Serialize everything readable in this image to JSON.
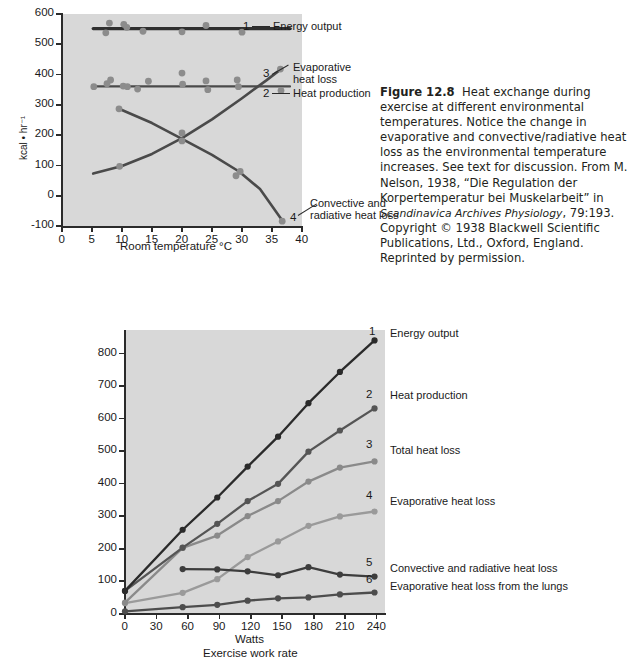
{
  "page": {
    "width": 637,
    "height": 668
  },
  "caption": {
    "figure_label": "Figure 12.8",
    "text_1": "Heat exchange during exercise at different environmental temperatures. Notice the change in evaporative and convective/radiative heat loss as the environmental temperature increases. See text for discussion. From M. Nelson, 1938, “Die Regulation der Korpertemperatur bei Muskelarbeit” in ",
    "italic_1": "Scandinavica Archives Physiology",
    "text_2": ", 79:193. Copyright © 1938 Blackwell Scientific Publications, Ltd., Oxford, England. Reprinted by permission."
  },
  "chart_data": [
    {
      "id": "figure-12-8-top",
      "type": "scatter",
      "title": "",
      "xlabel": "Room temperature °C",
      "ylabel": "kcal • hr⁻¹",
      "xlim": [
        0,
        40
      ],
      "ylim": [
        -100,
        600
      ],
      "xticks": [
        "0",
        "5",
        "10",
        "15",
        "20",
        "25",
        "30",
        "35",
        "40"
      ],
      "yticks": [
        "600",
        "500",
        "400",
        "300",
        "200",
        "100",
        "0",
        "-100"
      ],
      "grid": false,
      "legend_position": "right-inline",
      "series": [
        {
          "num": "1",
          "name": "Energy output",
          "color": "#2f2f2f",
          "fit": "flat",
          "fit_value": 552,
          "fit_x": [
            5.2,
            38.0
          ],
          "points": [
            {
              "x": 7.3,
              "y": 538
            },
            {
              "x": 7.9,
              "y": 570
            },
            {
              "x": 10.3,
              "y": 566
            },
            {
              "x": 10.8,
              "y": 556
            },
            {
              "x": 13.5,
              "y": 543
            },
            {
              "x": 20.0,
              "y": 541
            },
            {
              "x": 24.0,
              "y": 562
            },
            {
              "x": 30.0,
              "y": 540
            }
          ]
        },
        {
          "num": "2",
          "name": "Heat production",
          "color": "#4a4a4a",
          "fit": "flat",
          "fit_value": 361,
          "fit_x": [
            5.2,
            38.0
          ],
          "points": [
            {
              "x": 5.3,
              "y": 360
            },
            {
              "x": 7.5,
              "y": 370
            },
            {
              "x": 8.1,
              "y": 382
            },
            {
              "x": 10.2,
              "y": 362
            },
            {
              "x": 10.9,
              "y": 360
            },
            {
              "x": 12.6,
              "y": 352
            },
            {
              "x": 14.4,
              "y": 378
            },
            {
              "x": 20.0,
              "y": 405
            },
            {
              "x": 20.1,
              "y": 368
            },
            {
              "x": 24.0,
              "y": 379
            },
            {
              "x": 24.3,
              "y": 350
            },
            {
              "x": 29.2,
              "y": 382
            },
            {
              "x": 29.4,
              "y": 360
            },
            {
              "x": 36.5,
              "y": 347
            }
          ]
        },
        {
          "num": "3",
          "name": "Evaporative heat loss",
          "color": "#4a4a4a",
          "fit": "rising-curve",
          "fit_points": [
            {
              "x": 5.2,
              "y": 73
            },
            {
              "x": 10.0,
              "y": 98
            },
            {
              "x": 15.0,
              "y": 138
            },
            {
              "x": 20.0,
              "y": 190
            },
            {
              "x": 25.0,
              "y": 252
            },
            {
              "x": 30.0,
              "y": 322
            },
            {
              "x": 34.0,
              "y": 380
            },
            {
              "x": 36.5,
              "y": 418
            }
          ],
          "points": [
            {
              "x": 9.6,
              "y": 97
            },
            {
              "x": 20.0,
              "y": 207
            },
            {
              "x": 36.4,
              "y": 418
            }
          ]
        },
        {
          "num": "4",
          "name": "Convective and radiative heat loss",
          "color": "#4a4a4a",
          "fit": "falling-curve",
          "fit_points": [
            {
              "x": 9.5,
              "y": 287
            },
            {
              "x": 15.0,
              "y": 240
            },
            {
              "x": 20.0,
              "y": 188
            },
            {
              "x": 25.0,
              "y": 135
            },
            {
              "x": 29.5,
              "y": 80
            },
            {
              "x": 33.0,
              "y": 22
            },
            {
              "x": 36.8,
              "y": -84
            }
          ],
          "points": [
            {
              "x": 9.5,
              "y": 287
            },
            {
              "x": 20.0,
              "y": 181
            },
            {
              "x": 29.0,
              "y": 66
            },
            {
              "x": 29.7,
              "y": 80
            },
            {
              "x": 36.7,
              "y": -84
            }
          ]
        }
      ]
    },
    {
      "id": "figure-12-8-bottom",
      "type": "line",
      "title": "",
      "xlabel": "Watts",
      "xlabel2": "Exercise work rate",
      "ylabel": "kcal • hr⁻¹",
      "xlim": [
        0,
        248
      ],
      "ylim": [
        0,
        870
      ],
      "xticks": [
        "0",
        "30",
        "60",
        "90",
        "120",
        "150",
        "180",
        "210",
        "240"
      ],
      "yticks": [
        "800",
        "700",
        "600",
        "500",
        "400",
        "300",
        "200",
        "100",
        "0"
      ],
      "grid": false,
      "legend_position": "right-inline",
      "series": [
        {
          "num": "1",
          "name": "Energy output",
          "color": "#2a2a2a",
          "x": [
            0,
            55,
            88,
            117,
            146,
            175,
            205,
            238
          ],
          "values": [
            68,
            256,
            355,
            450,
            542,
            645,
            741,
            838
          ]
        },
        {
          "num": "2",
          "name": "Heat production",
          "color": "#555555",
          "x": [
            0,
            55,
            88,
            117,
            146,
            175,
            205,
            238
          ],
          "values": [
            68,
            201,
            274,
            344,
            397,
            496,
            561,
            629
          ]
        },
        {
          "num": "3",
          "name": "Total heat loss",
          "color": "#9a9a9a",
          "x": [
            0,
            55,
            88,
            117,
            146,
            175,
            205,
            238
          ],
          "values": [
            30,
            62,
            104,
            172,
            220,
            268,
            297,
            312
          ]
        },
        {
          "num": "4",
          "name": "Evaporative heat loss",
          "color": "#8a8a8a",
          "x": [
            0,
            55,
            88,
            117,
            146,
            175,
            205,
            238
          ],
          "values": [
            32,
            200,
            238,
            298,
            344,
            404,
            447,
            466
          ]
        },
        {
          "num": "5",
          "name": "Convective and radiative heat loss",
          "color": "#3d3d3d",
          "x": [
            55,
            88,
            117,
            146,
            175,
            205,
            238
          ],
          "values": [
            135,
            134,
            128,
            116,
            141,
            118,
            112
          ]
        },
        {
          "num": "6",
          "name": "Evaporative heat loss from the lungs",
          "color": "#4d4d4d",
          "x": [
            0,
            55,
            88,
            117,
            146,
            175,
            205,
            238
          ],
          "values": [
            5,
            18,
            25,
            38,
            45,
            48,
            57,
            63
          ]
        }
      ]
    }
  ],
  "top_chart_labels": {
    "n1": "1",
    "l1": "Energy output",
    "n3": "3",
    "l3_line1": "Evaporative",
    "l3_line2": "heat loss",
    "n2": "2",
    "l2": "Heat production",
    "n4": "4",
    "l4_line1": "Convective and",
    "l4_line2": "radiative heat loss"
  },
  "bottom_chart_labels": {
    "n1": "1",
    "l1": "Energy output",
    "n2": "2",
    "l2": "Heat production",
    "n3": "3",
    "l3": "Total heat loss",
    "n4": "4",
    "l4": "Evaporative heat loss",
    "n5": "5",
    "l5": "Convective and radiative heat loss",
    "n6": "6",
    "l6": "Evaporative heat loss from the lungs"
  }
}
